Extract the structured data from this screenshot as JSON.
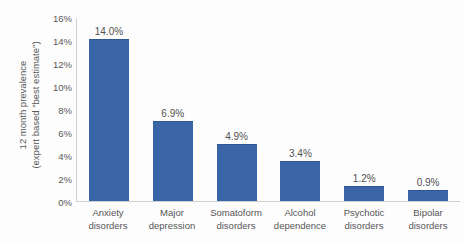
{
  "chart_data": {
    "type": "bar",
    "title": "",
    "subtitle": "",
    "xlabel": "",
    "ylabel": "12 month prevalence (expert based \"best estimate\")",
    "ylabel_lines": [
      "12 month prevalence",
      "(expert based \"best estimate\")"
    ],
    "categories": [
      "Anxiety disorders",
      "Major depression",
      "Somatoform disorders",
      "Alcohol dependence",
      "Psychotic disorders",
      "Bipolar disorders"
    ],
    "category_lines": [
      [
        "Anxiety",
        "disorders"
      ],
      [
        "Major",
        "depression"
      ],
      [
        "Somatoform",
        "disorders"
      ],
      [
        "Alcohol",
        "dependence"
      ],
      [
        "Psychotic",
        "disorders"
      ],
      [
        "Bipolar",
        "disorders"
      ]
    ],
    "values": [
      14.0,
      6.9,
      4.9,
      3.4,
      1.2,
      0.9
    ],
    "data_labels": [
      "14.0%",
      "6.9%",
      "4.9%",
      "3.4%",
      "1.2%",
      "0.9%"
    ],
    "ylim": [
      0,
      16
    ],
    "ytick_values": [
      0,
      2,
      4,
      6,
      8,
      10,
      12,
      14,
      16
    ],
    "ytick_labels": [
      "0%",
      "2%",
      "4%",
      "6%",
      "8%",
      "10%",
      "12%",
      "14%",
      "16%"
    ],
    "grid": false,
    "legend": false,
    "legend_position": "none",
    "bar_color": "#3a66a7",
    "axis_color": "#d0d0d0",
    "text_color": "#555555",
    "background_color": "#fdfdfd"
  }
}
